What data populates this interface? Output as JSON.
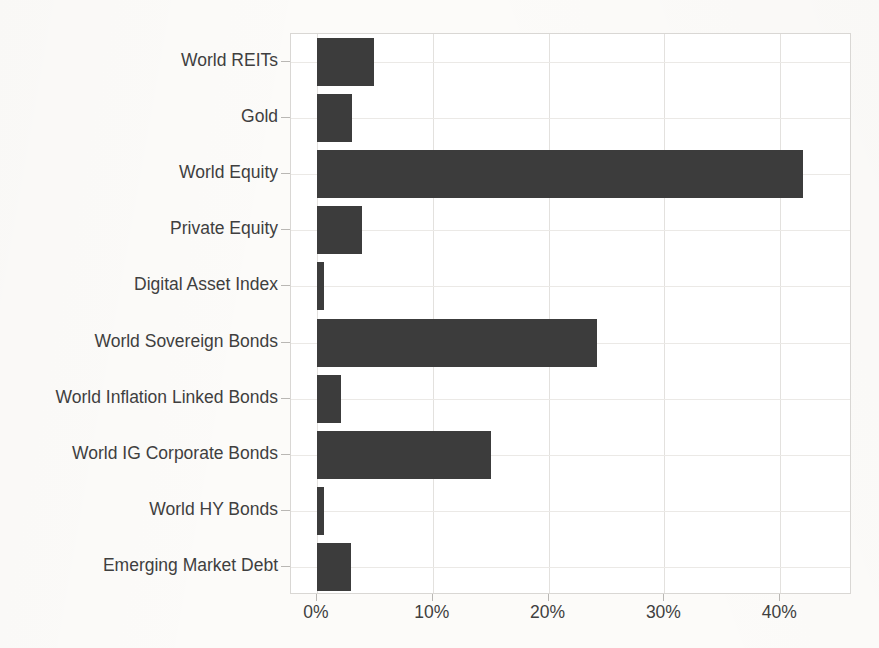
{
  "chart_data": {
    "type": "bar",
    "orientation": "horizontal",
    "title": "",
    "subtitle": "",
    "xlabel": "",
    "ylabel": "",
    "categories": [
      "World REITs",
      "Gold",
      "World Equity",
      "Private Equity",
      "Digital Asset Index",
      "World Sovereign Bonds",
      "World Inflation Linked Bonds",
      "World IG Corporate Bonds",
      "World HY Bonds",
      "Emerging Market Debt"
    ],
    "values": [
      4.9,
      3.0,
      42.0,
      3.9,
      0.6,
      24.2,
      2.1,
      15.0,
      0.6,
      2.9
    ],
    "value_unit": "%",
    "xlim": [
      0,
      46.2
    ],
    "ylim": [
      0,
      10
    ],
    "xticks": [
      0,
      10,
      20,
      30,
      40
    ],
    "xticklabels": [
      "0%",
      "10%",
      "20%",
      "30%",
      "40%"
    ],
    "grid": true,
    "grid_axis": "both",
    "legend": false,
    "legend_position": "none",
    "bar_color": "#3c3c3c",
    "background_color": "#ffffff",
    "gridline_color": "#e3e1de",
    "axis_color": "#d9d7d4",
    "text_color": "#3f3f3f"
  },
  "axes": {
    "x_tick_labels": [
      "0%",
      "10%",
      "20%",
      "30%",
      "40%"
    ],
    "y_tick_labels": [
      "World REITs",
      "Gold",
      "World Equity",
      "Private Equity",
      "Digital Asset Index",
      "World Sovereign Bonds",
      "World Inflation Linked Bonds",
      "World IG Corporate Bonds",
      "World HY Bonds",
      "Emerging Market Debt"
    ]
  }
}
